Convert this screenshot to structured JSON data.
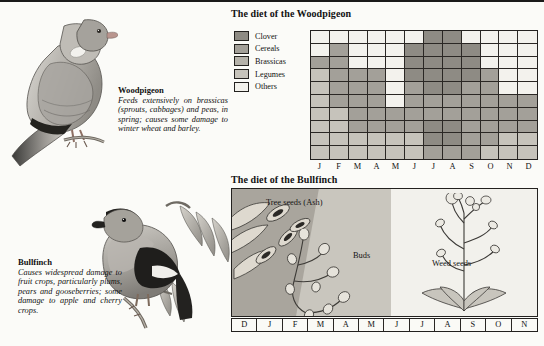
{
  "colors": {
    "clover": "#8e8b84",
    "cereals": "#a3a099",
    "brassicas": "#b5b2aa",
    "legumes": "#c6c3bb",
    "others": "#f3f2ed",
    "ink": "#23211f",
    "page": "#fbfbf8"
  },
  "species": [
    {
      "name": "Woodpigeon",
      "description": "Feeds extensively on brassicas (sprouts, cabbages) and peas, in spring; causes some damage to winter wheat and barley.",
      "illustration": "woodpigeon-illustration"
    },
    {
      "name": "Bullfinch",
      "description": "Causes widespread damage to fruit crops, particularly plums, pears and gooseberries; some damage to apple and cherry crops.",
      "illustration": "bullfinch-illustration"
    }
  ],
  "woodpigeon_chart": {
    "title": "The diet of the Woodpigeon",
    "legend": [
      {
        "label": "Clover",
        "color": "#8e8b84"
      },
      {
        "label": "Cereals",
        "color": "#a3a099"
      },
      {
        "label": "Brassicas",
        "color": "#b5b2aa"
      },
      {
        "label": "Legumes",
        "color": "#c6c3bb"
      },
      {
        "label": "Others",
        "color": "#f3f2ed"
      }
    ],
    "months": [
      "J",
      "F",
      "M",
      "A",
      "M",
      "J",
      "J",
      "A",
      "S",
      "O",
      "N",
      "D"
    ]
  },
  "bullfinch_chart": {
    "title": "The diet of the Bullfinch",
    "bands": [
      {
        "label": "Tree seeds (Ash)",
        "color": "#a9a59d"
      },
      {
        "label": "Buds",
        "color": "#c9c6be"
      },
      {
        "label": "Weed seeds",
        "color": "#f2f1ec"
      }
    ],
    "months": [
      "D",
      "J",
      "F",
      "M",
      "A",
      "M",
      "J",
      "J",
      "A",
      "S",
      "O",
      "N"
    ]
  },
  "chart_data": [
    {
      "type": "heatmap",
      "title": "The diet of the Woodpigeon",
      "xlabel": "",
      "ylabel": "",
      "grid": true,
      "legend_position": "left",
      "categories": [
        "J",
        "F",
        "M",
        "A",
        "M",
        "J",
        "J",
        "A",
        "S",
        "O",
        "N",
        "D"
      ],
      "rows": 10,
      "row_note": "Each row is one tenth of the diet; stacked from top (row 1) to bottom (row 10).",
      "legend": [
        "Clover",
        "Cereals",
        "Brassicas",
        "Legumes",
        "Others"
      ],
      "cells": [
        [
          "Others",
          "Others",
          "Others",
          "Others",
          "Others",
          "Others",
          "Clover",
          "Clover",
          "Others",
          "Others",
          "Others",
          "Others"
        ],
        [
          "Others",
          "Cereals",
          "Others",
          "Others",
          "Others",
          "Clover",
          "Clover",
          "Clover",
          "Clover",
          "Others",
          "Others",
          "Others"
        ],
        [
          "Cereals",
          "Cereals",
          "Others",
          "Others",
          "Others",
          "Clover",
          "Clover",
          "Clover",
          "Clover",
          "Others",
          "Others",
          "Others"
        ],
        [
          "Legumes",
          "Cereals",
          "Cereals",
          "Cereals",
          "Others",
          "Clover",
          "Clover",
          "Clover",
          "Clover",
          "Cereals",
          "Others",
          "Others"
        ],
        [
          "Legumes",
          "Cereals",
          "Cereals",
          "Cereals",
          "Others",
          "Cereals",
          "Clover",
          "Clover",
          "Cereals",
          "Cereals",
          "Others",
          "Others"
        ],
        [
          "Legumes",
          "Cereals",
          "Cereals",
          "Cereals",
          "Others",
          "Cereals",
          "Cereals",
          "Cereals",
          "Cereals",
          "Cereals",
          "Cereals",
          "Cereals"
        ],
        [
          "Legumes",
          "Legumes",
          "Cereals",
          "Cereals",
          "Cereals",
          "Cereals",
          "Cereals",
          "Cereals",
          "Cereals",
          "Cereals",
          "Cereals",
          "Cereals"
        ],
        [
          "Legumes",
          "Legumes",
          "Cereals",
          "Cereals",
          "Cereals",
          "Cereals",
          "Clover",
          "Clover",
          "Cereals",
          "Cereals",
          "Cereals",
          "Cereals"
        ],
        [
          "Legumes",
          "Legumes",
          "Legumes",
          "Legumes",
          "Legumes",
          "Legumes",
          "Clover",
          "Clover",
          "Cereals",
          "Cereals",
          "Legumes",
          "Legumes"
        ],
        [
          "Legumes",
          "Legumes",
          "Legumes",
          "Legumes",
          "Legumes",
          "Legumes",
          "Cereals",
          "Cereals",
          "Cereals",
          "Legumes",
          "Legumes",
          "Legumes"
        ]
      ]
    },
    {
      "type": "bar",
      "orientation": "horizontal-timeline",
      "title": "The diet of the Bullfinch",
      "categories": [
        "D",
        "J",
        "F",
        "M",
        "A",
        "M",
        "J",
        "J",
        "A",
        "S",
        "O",
        "N"
      ],
      "series": [
        {
          "name": "Tree seeds (Ash)",
          "span_months": [
            "D",
            "J",
            "F"
          ],
          "color": "#a9a59d"
        },
        {
          "name": "Buds",
          "span_months": [
            "F",
            "M",
            "A"
          ],
          "color": "#c9c6be"
        },
        {
          "name": "Weed seeds",
          "span_months": [
            "M",
            "J",
            "J",
            "A",
            "S",
            "O",
            "N"
          ],
          "color": "#f2f1ec"
        }
      ]
    }
  ]
}
